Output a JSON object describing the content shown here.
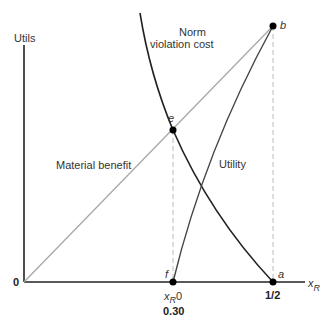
{
  "diagram": {
    "y_axis_label": "Utils",
    "x_axis_label": "x",
    "x_axis_label_sub": "R",
    "origin_label": "0",
    "curves": {
      "norm_violation_cost": {
        "line1": "Norm",
        "line2": "violation cost",
        "color": "#222222"
      },
      "material_benefit": {
        "label": "Material benefit",
        "color": "#a8a8a8"
      },
      "utility": {
        "label": "Utility",
        "color": "#444444"
      }
    },
    "points": {
      "a": "a",
      "b": "b",
      "e": "e",
      "f": "f"
    },
    "ticks": {
      "xr0_main": "x",
      "xr0_sub": "R",
      "xr0_suffix": "0",
      "xr0_value": "0.30",
      "half": "1/2"
    },
    "colors": {
      "axis": "#222222",
      "dashed_guides": "#bbbbbb",
      "points": "#000000"
    }
  }
}
